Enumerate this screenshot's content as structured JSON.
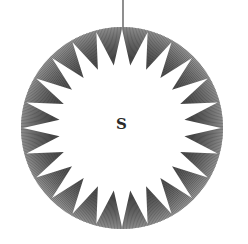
{
  "figure": {
    "center_label": "S",
    "points": 24,
    "ring_color": "#555555",
    "hatch_color": "#333333",
    "star_color": "#ffffff",
    "thread_color": "#444444"
  }
}
